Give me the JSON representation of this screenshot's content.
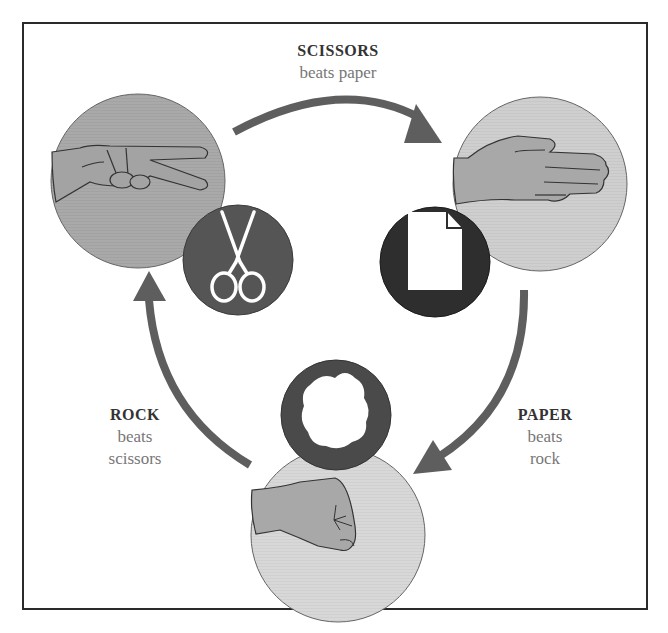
{
  "diagram": {
    "colors": {
      "arrow": "#5e5e5e",
      "scissors_hand_bg": "#a9a9a9",
      "paper_hand_bg": "#cfcfcf",
      "rock_hand_bg": "#d8d8d8",
      "scissors_icon_bg": "#555555",
      "paper_icon_bg": "#2e2e2e",
      "rock_icon_bg": "#4a4a4a",
      "skin": "#a3a3a3",
      "frame": "#2a2a2a"
    },
    "nodes": [
      {
        "id": "scissors",
        "hand_icon": "scissors-hand-icon",
        "symbol_icon": "scissors-icon"
      },
      {
        "id": "paper",
        "hand_icon": "open-hand-icon",
        "symbol_icon": "document-icon"
      },
      {
        "id": "rock",
        "hand_icon": "fist-icon",
        "symbol_icon": "rock-ring-icon"
      }
    ],
    "edges": [
      {
        "from": "scissors",
        "to": "paper",
        "title": "SCISSORS",
        "subtitle": "beats paper"
      },
      {
        "from": "paper",
        "to": "rock",
        "title": "PAPER",
        "subtitle_line1": "beats",
        "subtitle_line2": "rock"
      },
      {
        "from": "rock",
        "to": "scissors",
        "title": "ROCK",
        "subtitle_line1": "beats",
        "subtitle_line2": "scissors"
      }
    ]
  }
}
